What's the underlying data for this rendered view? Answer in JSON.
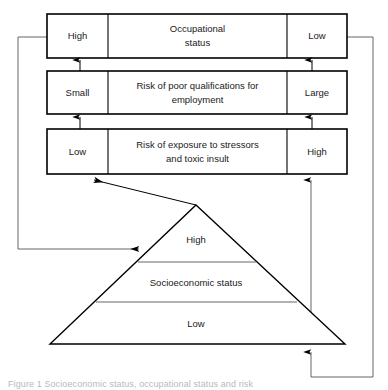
{
  "figure": {
    "caption": "Figure 1 Socioeconomic status, occupational status and risk"
  },
  "boxes": [
    {
      "id": "occupational-status",
      "left_label": "High",
      "center_label_line1": "Occupational",
      "center_label_line2": "status",
      "right_label": "Low"
    },
    {
      "id": "risk-poor-qualifications",
      "left_label": "Small",
      "center_label_line1": "Risk of poor qualifications for",
      "center_label_line2": "employment",
      "right_label": "Large"
    },
    {
      "id": "risk-exposure-stressors",
      "left_label": "Low",
      "center_label_line1": "Risk of exposure to stressors",
      "center_label_line2": "and toxic insult",
      "right_label": "High"
    }
  ],
  "pyramid": {
    "id": "socioeconomic-status-pyramid",
    "top_label": "High",
    "middle_label": "Socioeconomic status",
    "bottom_label": "Low"
  },
  "colors": {
    "stroke": "#000000",
    "connector": "#555555",
    "background": "#ffffff",
    "text": "#1a1a1a"
  }
}
